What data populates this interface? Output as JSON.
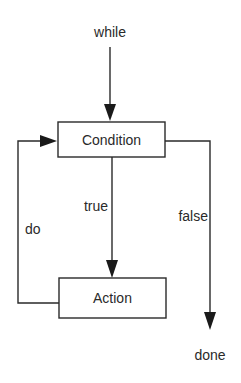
{
  "diagram": {
    "start_label": "while",
    "nodes": [
      {
        "id": "condition",
        "label": "Condition"
      },
      {
        "id": "action",
        "label": "Action"
      }
    ],
    "edges": [
      {
        "from": "while",
        "to": "condition",
        "label": ""
      },
      {
        "from": "condition",
        "to": "action",
        "label": "true"
      },
      {
        "from": "action",
        "to": "condition",
        "label": "do"
      },
      {
        "from": "condition",
        "to": "done",
        "label": "false"
      }
    ],
    "labels": {
      "while": "while",
      "condition": "Condition",
      "action": "Action",
      "true": "true",
      "false": "false",
      "do": "do",
      "done": "done"
    },
    "colors": {
      "line": "#2a2a2a",
      "background": "#ffffff"
    }
  }
}
